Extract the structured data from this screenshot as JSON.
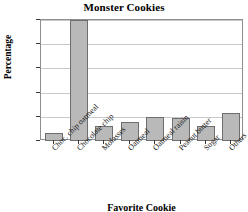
{
  "chart_data": {
    "type": "bar",
    "title": "Monster Cookies",
    "xlabel": "Favorite Cookie",
    "ylabel": "Percentage",
    "categories": [
      "Choc. chip oatmeal",
      "Chocolate chip",
      "Molasses",
      "Oatmeal",
      "Oatmeal raisin",
      "Peanut butter",
      "Sugar",
      "Others"
    ],
    "values": [
      3.5,
      50,
      6,
      8,
      10,
      9.5,
      6,
      11.5
    ],
    "ylim": [
      0,
      50
    ],
    "yticks": [
      0,
      10,
      20,
      30,
      40,
      50
    ],
    "ytick_labels": [
      "0",
      "10",
      "20",
      "30",
      "40",
      "50"
    ],
    "grid": true,
    "legend": false,
    "bar_color": "#b9b9b9",
    "bar_border_color": "#6e6e6e",
    "grid_color": "#c9c9c9",
    "axis_color": "#8e8e8e"
  }
}
